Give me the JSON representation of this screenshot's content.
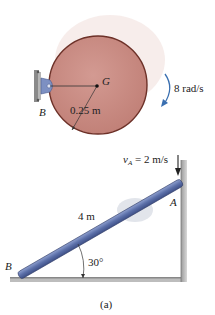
{
  "figure_a_top": {
    "disk": {
      "center_label": "G",
      "pin_label": "B",
      "radius_label": "0.25 m",
      "angular_velocity_label": "8 rad/s",
      "fill_color": "#c98c84",
      "rim_color": "#7a3a30"
    }
  },
  "figure_a_bottom": {
    "rod": {
      "length_label": "4 m",
      "end_top_label": "A",
      "end_bottom_label": "B",
      "angle_label": "30°",
      "velocity_label_symbol": "v",
      "velocity_label_sub": "A",
      "velocity_label_value": " = 2 m/s",
      "rod_color": "#5b6fa8"
    }
  },
  "caption": "(a)"
}
